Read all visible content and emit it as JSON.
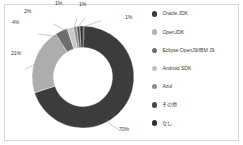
{
  "chart_data": {
    "type": "pie",
    "variant": "donut",
    "title": "",
    "subtitle": "",
    "xlabel": "",
    "ylabel": "",
    "legend_position": "right",
    "grid": false,
    "units": "percent",
    "categories": [
      "Oracle JDK",
      "OpenJDK",
      "Eclipse OpenJ9/IBM J9",
      "Android SDK",
      "Azul",
      "その他",
      "なし"
    ],
    "values": [
      70,
      21,
      4,
      2,
      1,
      1,
      1
    ],
    "data_labels": [
      "70%",
      "21%",
      "4%",
      "2%",
      "1%",
      "1%",
      "1%"
    ],
    "colors": [
      "#3c3c3c",
      "#adadad",
      "#6e6e6e",
      "#c9c9c9",
      "#8c8c8c",
      "#565656",
      "#2f2f2f"
    ],
    "slices": [
      {
        "label": "Oracle JDK",
        "value": 70,
        "display": "70%",
        "color": "#3c3c3c"
      },
      {
        "label": "OpenJDK",
        "value": 21,
        "display": "21%",
        "color": "#adadad"
      },
      {
        "label": "Eclipse OpenJ9/IBM J9",
        "value": 4,
        "display": "4%",
        "color": "#6e6e6e"
      },
      {
        "label": "Android SDK",
        "value": 2,
        "display": "2%",
        "color": "#c9c9c9"
      },
      {
        "label": "Azul",
        "value": 1,
        "display": "1%",
        "color": "#8c8c8c"
      },
      {
        "label": "その他",
        "value": 1,
        "display": "1%",
        "color": "#565656"
      },
      {
        "label": "なし",
        "value": 1,
        "display": "1%",
        "color": "#2f2f2f"
      }
    ]
  },
  "legend": {
    "items": [
      {
        "label": "Oracle JDK",
        "color": "#3c3c3c"
      },
      {
        "label": "OpenJDK",
        "color": "#b4b4b4"
      },
      {
        "label": "Eclipse OpenJ9/IBM J9",
        "color": "#6e6e6e"
      },
      {
        "label": "Android SDK",
        "color": "#c2c2c2"
      },
      {
        "label": "Azul",
        "color": "#8c8c8c"
      },
      {
        "label": "その他",
        "color": "#4a4a4a"
      },
      {
        "label": "なし",
        "color": "#303030"
      }
    ]
  },
  "style": {
    "background": "#ffffff",
    "border_color": "#d8d8d8",
    "label_color": "#3b3b3b",
    "leader_color": "#8a8a8a"
  }
}
